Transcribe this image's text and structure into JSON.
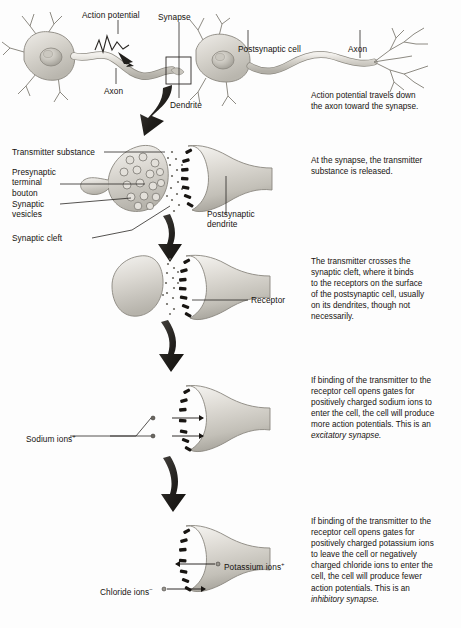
{
  "figure": {
    "background_color": "#fdfdfd",
    "ink_color": "#15120f",
    "cell_fill": "#d9d7d2"
  },
  "panels": [
    {
      "id": "panel-1-neurons",
      "caption": "Action potential travels down\nthe axon toward the synapse.",
      "labels": [
        {
          "name": "action-potential",
          "text": "Action potential"
        },
        {
          "name": "synapse",
          "text": "Synapse"
        },
        {
          "name": "postsynaptic-cell",
          "text": "Postsynaptic cell"
        },
        {
          "name": "axon-right",
          "text": "Axon"
        },
        {
          "name": "axon-left",
          "text": "Axon"
        },
        {
          "name": "dendrite",
          "text": "Dendrite"
        }
      ]
    },
    {
      "id": "panel-2-release",
      "caption": "At the synapse, the transmitter\nsubstance is released.",
      "labels": [
        {
          "name": "transmitter-substance",
          "text": "Transmitter substance"
        },
        {
          "name": "presynaptic-terminal-bouton",
          "text": "Presynaptic\nterminal\nbouton"
        },
        {
          "name": "synaptic-vesicles",
          "text": "Synaptic\nvesicles"
        },
        {
          "name": "synaptic-cleft",
          "text": "Synaptic cleft"
        },
        {
          "name": "postsynaptic-dendrite",
          "text": "Postsynaptic\ndendrite"
        }
      ]
    },
    {
      "id": "panel-3-binding",
      "caption": "The transmitter crosses the\nsynaptic cleft, where it binds\nto the receptors on the surface\nof the postsynaptic cell, usually\non its dendrites, though not\nnecessarily.",
      "labels": [
        {
          "name": "receptor",
          "text": "Receptor"
        }
      ]
    },
    {
      "id": "panel-4-excitatory",
      "caption_pre": "If binding of the transmitter to the\nreceptor cell opens gates for\npositively charged sodium ions to\nenter the cell, the cell will produce\nmore action potentials. This is an\n",
      "caption_em": "excitatory synapse.",
      "labels": [
        {
          "name": "sodium-ions",
          "text": "Sodium ions",
          "charge": "+"
        }
      ]
    },
    {
      "id": "panel-5-inhibitory",
      "caption_pre": "If binding of the transmitter to the\nreceptor cell opens gates for\npositively charged potassium ions\nto leave the cell or negatively\ncharged chloride ions to enter the\ncell, the cell will produce fewer\naction potentials. This is an\n",
      "caption_em": "inhibitory synapse.",
      "labels": [
        {
          "name": "potassium-ions",
          "text": "Potassium ions",
          "charge": "+"
        },
        {
          "name": "chloride-ions",
          "text": "Chloride ions",
          "charge": "−"
        }
      ]
    }
  ]
}
